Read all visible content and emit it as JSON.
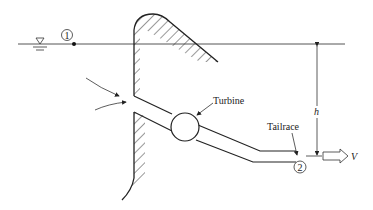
{
  "diagram": {
    "type": "hydroelectric dam with turbine schematic",
    "labels": {
      "point1": "1",
      "point2": "2",
      "turbine": "Turbine",
      "tailrace": "Tailrace",
      "head": "h",
      "velocity": "V"
    },
    "colors": {
      "stroke": "#222222",
      "water_line": "#555555",
      "background": "#ffffff"
    }
  }
}
